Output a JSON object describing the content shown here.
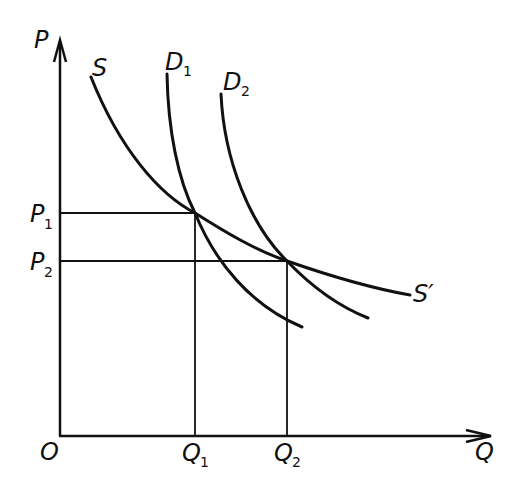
{
  "diagram": {
    "axes": {
      "y_label": "P",
      "x_label": "Q",
      "origin_label": "O"
    },
    "price_levels": [
      {
        "label": "P",
        "sub": "1"
      },
      {
        "label": "P",
        "sub": "2"
      }
    ],
    "quantity_levels": [
      {
        "label": "Q",
        "sub": "1"
      },
      {
        "label": "Q",
        "sub": "2"
      }
    ],
    "curves": {
      "supply_start_label": "S",
      "supply_end_label": "S′",
      "demand1": {
        "label": "D",
        "sub": "1"
      },
      "demand2": {
        "label": "D",
        "sub": "2"
      }
    },
    "equilibria": [
      {
        "name": "E1",
        "price": "P1",
        "quantity": "Q1",
        "curves": [
          "S",
          "D1"
        ]
      },
      {
        "name": "E2",
        "price": "P2",
        "quantity": "Q2",
        "curves": [
          "S",
          "D2"
        ]
      }
    ],
    "colors": {
      "ink": "#111111",
      "background": "#ffffff"
    }
  }
}
